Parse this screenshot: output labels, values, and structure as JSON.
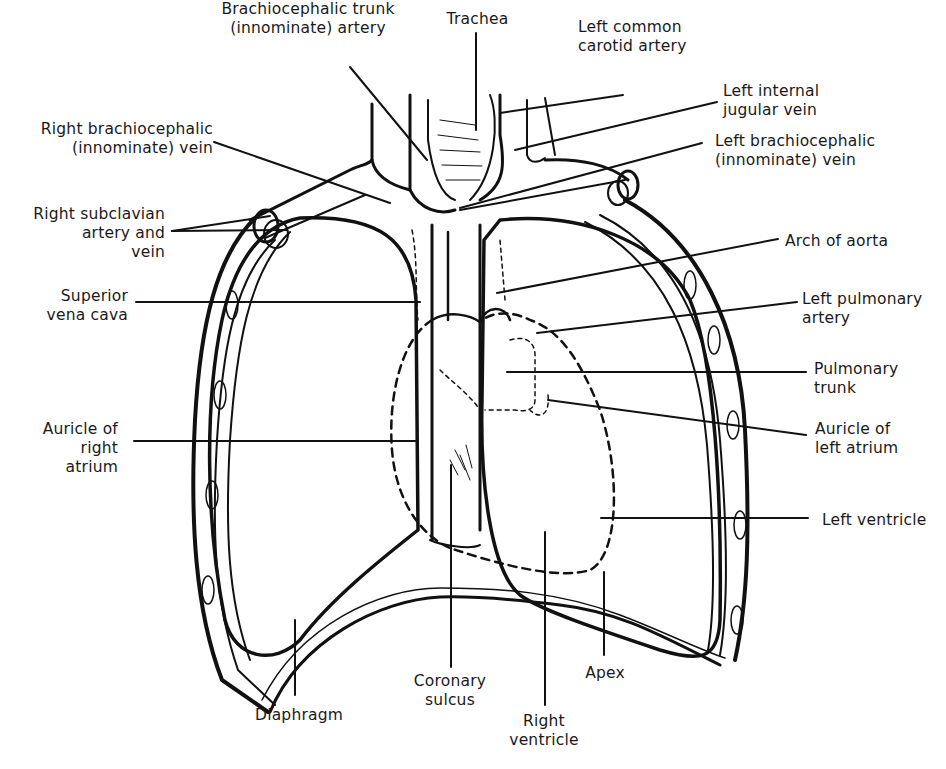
{
  "diagram": {
    "labels": [
      {
        "id": "brachiocephalic-trunk",
        "text": "Brachiocephalic trunk\n(innominate) artery",
        "x": 218,
        "y": 0,
        "align": "c",
        "w": 180,
        "leader": [
          [
            350,
            67
          ],
          [
            427,
            160
          ]
        ]
      },
      {
        "id": "trachea",
        "text": "Trachea",
        "x": 440,
        "y": 10,
        "align": "c",
        "w": 75,
        "leader": [
          [
            476,
            33
          ],
          [
            476,
            130
          ]
        ]
      },
      {
        "id": "left-common-carotid",
        "text": "Left common\ncarotid artery",
        "x": 578,
        "y": 18,
        "align": "l",
        "w": 130,
        "leader": [
          [
            623,
            95
          ],
          [
            500,
            113
          ]
        ]
      },
      {
        "id": "left-internal-jugular",
        "text": "Left internal\njugular vein",
        "x": 723,
        "y": 82,
        "align": "l",
        "w": 120,
        "leader": [
          [
            717,
            102
          ],
          [
            515,
            150
          ]
        ]
      },
      {
        "id": "left-brachiocephalic-vein",
        "text": "Left brachiocephalic\n(innominate) vein",
        "x": 715,
        "y": 132,
        "align": "l",
        "w": 200,
        "leader": [
          [
            702,
            143
          ],
          [
            460,
            208
          ]
        ]
      },
      {
        "id": "right-brachiocephalic-vein",
        "text": "Right brachiocephalic\n(innominate) vein",
        "x": 28,
        "y": 120,
        "align": "r",
        "w": 185,
        "leader": [
          [
            214,
            142
          ],
          [
            390,
            203
          ]
        ]
      },
      {
        "id": "right-subclavian",
        "text": "Right subclavian\n artery and\nvein",
        "x": 25,
        "y": 205,
        "align": "r",
        "w": 140,
        "leader": [
          [
            172,
            231
          ],
          [
            270,
            216
          ]
        ],
        "leader2": [
          [
            172,
            231
          ],
          [
            287,
            230
          ]
        ]
      },
      {
        "id": "arch-of-aorta",
        "text": "Arch of aorta",
        "x": 785,
        "y": 232,
        "align": "l",
        "w": 130,
        "leader": [
          [
            778,
            239
          ],
          [
            497,
            293
          ]
        ]
      },
      {
        "id": "superior-vena-cava",
        "text": "Superior\nvena cava",
        "x": 40,
        "y": 287,
        "align": "r",
        "w": 88,
        "leader": [
          [
            136,
            302
          ],
          [
            420,
            302
          ]
        ]
      },
      {
        "id": "left-pulmonary-artery",
        "text": "Left pulmonary\nartery",
        "x": 802,
        "y": 290,
        "align": "l",
        "w": 130,
        "leader": [
          [
            797,
            302
          ],
          [
            537,
            333
          ]
        ]
      },
      {
        "id": "pulmonary-trunk",
        "text": "Pulmonary\ntrunk",
        "x": 814,
        "y": 360,
        "align": "l",
        "w": 110,
        "leader": [
          [
            806,
            372
          ],
          [
            507,
            372
          ]
        ]
      },
      {
        "id": "auricle-right-atrium",
        "text": "Auricle of\nright\natrium",
        "x": 30,
        "y": 420,
        "align": "r",
        "w": 88,
        "leader": [
          [
            134,
            441
          ],
          [
            418,
            441
          ]
        ]
      },
      {
        "id": "auricle-left-atrium",
        "text": "Auricle of\nleft atrium",
        "x": 815,
        "y": 420,
        "align": "l",
        "w": 110,
        "leader": [
          [
            806,
            435
          ],
          [
            548,
            400
          ]
        ]
      },
      {
        "id": "left-ventricle",
        "text": "Left ventricle",
        "x": 822,
        "y": 511,
        "align": "l",
        "w": 120,
        "leader": [
          [
            808,
            518
          ],
          [
            601,
            518
          ]
        ]
      },
      {
        "id": "diaphragm",
        "text": "Diaphragm",
        "x": 255,
        "y": 706,
        "align": "l",
        "w": 100,
        "leader": [
          [
            295,
            695
          ],
          [
            295,
            620
          ]
        ]
      },
      {
        "id": "coronary-sulcus",
        "text": "Coronary\nsulcus",
        "x": 405,
        "y": 672,
        "align": "c",
        "w": 90,
        "leader": [
          [
            451,
            667
          ],
          [
            451,
            465
          ]
        ]
      },
      {
        "id": "right-ventricle",
        "text": "Right\nventricle",
        "x": 504,
        "y": 712,
        "align": "c",
        "w": 80,
        "leader": [
          [
            545,
            705
          ],
          [
            545,
            532
          ]
        ]
      },
      {
        "id": "apex",
        "text": "Apex",
        "x": 580,
        "y": 664,
        "align": "c",
        "w": 50,
        "leader": [
          [
            604,
            655
          ],
          [
            604,
            572
          ]
        ]
      }
    ]
  }
}
